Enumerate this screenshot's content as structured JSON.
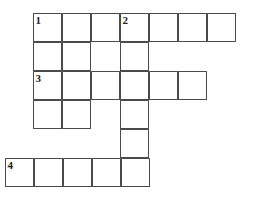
{
  "puzzle": {
    "kind": "crossword-grid",
    "title": "Crossword Puzzle Grid",
    "geometry": {
      "cell_size": 29,
      "origin_x": 33,
      "origin_y": 13,
      "row_offsets": [
        0,
        0,
        0,
        0,
        0,
        -28
      ],
      "border_color": "#4a4a4a",
      "cell_fill": "#ffffff",
      "page_background": "#ffffff",
      "number_color": "#1c1c1c"
    },
    "rows": [
      {
        "index": 1,
        "columns": [
          1,
          2,
          3,
          4,
          5,
          6,
          7
        ],
        "cells": [
          {
            "col": 1,
            "number": "1",
            "letter": ""
          },
          {
            "col": 2,
            "number": "",
            "letter": ""
          },
          {
            "col": 3,
            "number": "",
            "letter": ""
          },
          {
            "col": 4,
            "number": "2",
            "letter": ""
          },
          {
            "col": 5,
            "number": "",
            "letter": ""
          },
          {
            "col": 6,
            "number": "",
            "letter": ""
          },
          {
            "col": 7,
            "number": "",
            "letter": ""
          }
        ]
      },
      {
        "index": 2,
        "columns": [
          1,
          2,
          4
        ],
        "cells": [
          {
            "col": 1,
            "number": "",
            "letter": ""
          },
          {
            "col": 2,
            "number": "",
            "letter": ""
          },
          {
            "col": 4,
            "number": "",
            "letter": ""
          }
        ]
      },
      {
        "index": 3,
        "columns": [
          1,
          2,
          3,
          4,
          5,
          6
        ],
        "cells": [
          {
            "col": 1,
            "number": "3",
            "letter": ""
          },
          {
            "col": 2,
            "number": "",
            "letter": ""
          },
          {
            "col": 3,
            "number": "",
            "letter": ""
          },
          {
            "col": 4,
            "number": "",
            "letter": ""
          },
          {
            "col": 5,
            "number": "",
            "letter": ""
          },
          {
            "col": 6,
            "number": "",
            "letter": ""
          }
        ]
      },
      {
        "index": 4,
        "columns": [
          1,
          2,
          4
        ],
        "cells": [
          {
            "col": 1,
            "number": "",
            "letter": ""
          },
          {
            "col": 2,
            "number": "",
            "letter": ""
          },
          {
            "col": 4,
            "number": "",
            "letter": ""
          }
        ]
      },
      {
        "index": 5,
        "columns": [
          4
        ],
        "cells": [
          {
            "col": 4,
            "number": "",
            "letter": ""
          }
        ]
      },
      {
        "index": 6,
        "columns": [
          1,
          2,
          3,
          4,
          5
        ],
        "cells": [
          {
            "col": 1,
            "number": "4",
            "letter": ""
          },
          {
            "col": 2,
            "number": "",
            "letter": ""
          },
          {
            "col": 3,
            "number": "",
            "letter": ""
          },
          {
            "col": 4,
            "number": "",
            "letter": ""
          },
          {
            "col": 5,
            "number": "",
            "letter": ""
          }
        ]
      }
    ],
    "clue_numbers": [
      "1",
      "2",
      "3",
      "4"
    ]
  }
}
